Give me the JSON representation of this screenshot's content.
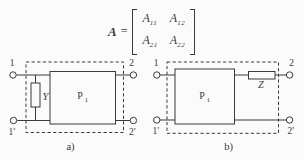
{
  "colors": {
    "ink": "#3a3a3a",
    "paper": "#fbfbfb"
  },
  "equation": {
    "lhs": "A",
    "equals": "=",
    "matrix": {
      "entries": [
        {
          "base": "A",
          "sub": "11"
        },
        {
          "base": "A",
          "sub": "12"
        },
        {
          "base": "A",
          "sub": "21"
        },
        {
          "base": "A",
          "sub": "22"
        }
      ]
    }
  },
  "diagram_a": {
    "caption": "a)",
    "terminals": {
      "top_left": "1",
      "top_right": "2",
      "bottom_left": "1′",
      "bottom_right": "2′"
    },
    "shunt_admittance_label": "Y",
    "network": {
      "base": "P",
      "sub": "1"
    }
  },
  "diagram_b": {
    "caption": "b)",
    "terminals": {
      "top_left": "1",
      "top_right": "2",
      "bottom_left": "1′",
      "bottom_right": "2′"
    },
    "series_impedance_label": "Z",
    "network": {
      "base": "P",
      "sub": "1"
    }
  }
}
